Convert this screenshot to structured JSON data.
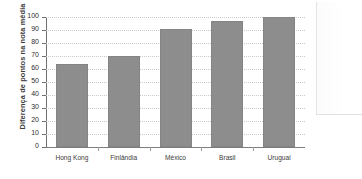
{
  "chart_data": {
    "type": "bar",
    "title": "",
    "subtitle": "",
    "xlabel": "",
    "ylabel": "Diferença de pontos na nota média",
    "categories": [
      "Hong Kong",
      "Finlândia",
      "México",
      "Brasil",
      "Uruguai"
    ],
    "values": [
      64,
      70,
      91,
      97,
      100
    ],
    "ylim": [
      0,
      100
    ],
    "ytick_step": 10,
    "yticks": [
      "0",
      "10",
      "20",
      "30",
      "40",
      "50",
      "60",
      "70",
      "80",
      "90",
      "100"
    ],
    "grid": true,
    "grid_axis": "y",
    "grid_style": "dotted",
    "legend": false,
    "legend_position": "none",
    "series": [
      {
        "name": "Diferença de pontos na nota média",
        "values": [
          64,
          70,
          91,
          97,
          100
        ]
      }
    ]
  },
  "style": {
    "bar_color": "#8d8d8d",
    "bar_edge_color": "#848484",
    "grid_color": "#c9c9c9",
    "axis_color": "#6f6f6f",
    "text_color": "#2f2f2f",
    "background": "#ffffff"
  }
}
